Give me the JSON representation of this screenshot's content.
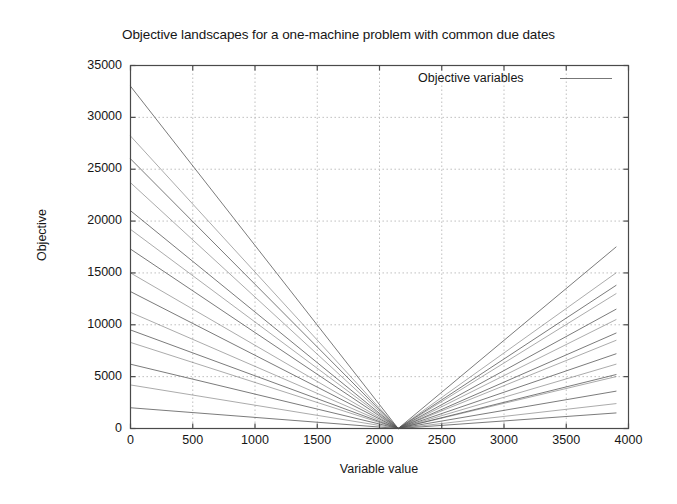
{
  "chart_data": {
    "type": "line",
    "title": "Objective landscapes for a one-machine problem with common due dates",
    "xlabel": "Variable value",
    "ylabel": "Objective",
    "xlim": [
      0,
      4000
    ],
    "ylim": [
      0,
      35000
    ],
    "xticks": [
      0,
      500,
      1000,
      1500,
      2000,
      2500,
      3000,
      3500,
      4000
    ],
    "yticks": [
      0,
      5000,
      10000,
      15000,
      20000,
      25000,
      30000,
      35000
    ],
    "grid": true,
    "legend_position": "top-right",
    "legend_entries": [
      "Objective variables"
    ],
    "annotations": [],
    "vertex_x": 2150,
    "vertex_y": 0,
    "x_start": 0,
    "x_end": 3900,
    "series": [
      {
        "name": "variable-1",
        "x": [
          0,
          2150,
          3900
        ],
        "values": [
          33000,
          0,
          17500
        ]
      },
      {
        "name": "variable-2",
        "x": [
          0,
          2150,
          3900
        ],
        "values": [
          28200,
          0,
          15000
        ]
      },
      {
        "name": "variable-3",
        "x": [
          0,
          2150,
          3900
        ],
        "values": [
          26000,
          0,
          13800
        ]
      },
      {
        "name": "variable-4",
        "x": [
          0,
          2150,
          3900
        ],
        "values": [
          23700,
          0,
          13000
        ]
      },
      {
        "name": "variable-5",
        "x": [
          0,
          2150,
          3900
        ],
        "values": [
          21000,
          0,
          11500
        ]
      },
      {
        "name": "variable-6",
        "x": [
          0,
          2150,
          3900
        ],
        "values": [
          19200,
          0,
          10500
        ]
      },
      {
        "name": "variable-7",
        "x": [
          0,
          2150,
          3900
        ],
        "values": [
          17300,
          0,
          9200
        ]
      },
      {
        "name": "variable-8",
        "x": [
          0,
          2150,
          3900
        ],
        "values": [
          15000,
          0,
          8500
        ]
      },
      {
        "name": "variable-9",
        "x": [
          0,
          2150,
          3900
        ],
        "values": [
          13200,
          0,
          7200
        ]
      },
      {
        "name": "variable-10",
        "x": [
          0,
          2150,
          3900
        ],
        "values": [
          11200,
          0,
          6200
        ]
      },
      {
        "name": "variable-11",
        "x": [
          0,
          2150,
          3900
        ],
        "values": [
          9500,
          0,
          5200
        ]
      },
      {
        "name": "variable-12",
        "x": [
          0,
          2150,
          3900
        ],
        "values": [
          8300,
          0,
          5000
        ]
      },
      {
        "name": "variable-13",
        "x": [
          0,
          2150,
          3900
        ],
        "values": [
          6200,
          0,
          3600
        ]
      },
      {
        "name": "variable-14",
        "x": [
          0,
          2150,
          3900
        ],
        "values": [
          4200,
          0,
          2400
        ]
      },
      {
        "name": "variable-15",
        "x": [
          0,
          2150,
          3900
        ],
        "values": [
          2000,
          0,
          1500
        ]
      }
    ]
  },
  "colors": {
    "background": "#ffffff",
    "frame": "#4a4a4a",
    "grid": "#b9b9b9",
    "series": "#555555",
    "text": "#161616"
  }
}
